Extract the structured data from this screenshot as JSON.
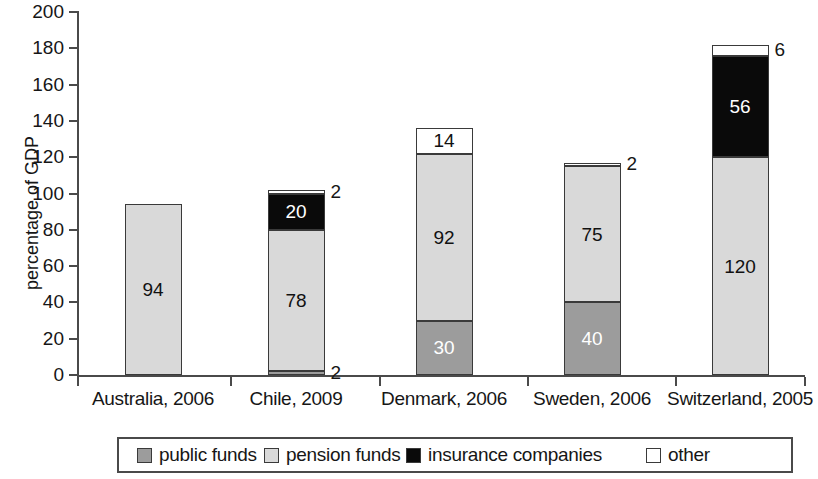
{
  "chart_data": {
    "type": "bar",
    "subtype": "stacked-bar",
    "title": "",
    "xlabel": "",
    "ylabel": "percentage of GDP",
    "ylim": [
      0,
      200
    ],
    "ytick_step": 20,
    "yticks": [
      "200",
      "180",
      "160",
      "140",
      "120",
      "100",
      "80",
      "60",
      "40",
      "20",
      "0"
    ],
    "grid": false,
    "legend_position": "bottom",
    "categories": [
      "Australia, 2006",
      "Chile, 2009",
      "Denmark, 2006",
      "Sweden, 2006",
      "Switzerland, 2005"
    ],
    "series": [
      {
        "name": "public funds",
        "color": "#9c9c9c",
        "values": [
          0,
          2,
          30,
          40,
          0
        ]
      },
      {
        "name": "pension funds",
        "color": "#d9d9d9",
        "values": [
          94,
          78,
          92,
          75,
          120
        ]
      },
      {
        "name": "insurance companies",
        "color": "#0a0a0a",
        "values": [
          0,
          20,
          0,
          0,
          56
        ]
      },
      {
        "name": "other",
        "color": "#ffffff",
        "values": [
          0,
          2,
          14,
          2,
          6
        ]
      }
    ],
    "totals": [
      94,
      102,
      136,
      117,
      182
    ]
  },
  "axis": {
    "y_title": "percentage of GDP"
  },
  "yticks": [
    {
      "value": "200"
    },
    {
      "value": "180"
    },
    {
      "value": "160"
    },
    {
      "value": "140"
    },
    {
      "value": "120"
    },
    {
      "value": "100"
    },
    {
      "value": "80"
    },
    {
      "value": "60"
    },
    {
      "value": "40"
    },
    {
      "value": "20"
    },
    {
      "value": "0"
    }
  ],
  "bars": [
    {
      "category": "Australia, 2006",
      "segments": [
        {
          "series": "pension funds",
          "value": 94,
          "label": "94",
          "label_placement": "inside"
        }
      ]
    },
    {
      "category": "Chile, 2009",
      "segments": [
        {
          "series": "public funds",
          "value": 2,
          "label": "2",
          "label_placement": "outside-right"
        },
        {
          "series": "pension funds",
          "value": 78,
          "label": "78",
          "label_placement": "inside"
        },
        {
          "series": "insurance companies",
          "value": 20,
          "label": "20",
          "label_placement": "inside"
        },
        {
          "series": "other",
          "value": 2,
          "label": "2",
          "label_placement": "outside-right"
        }
      ]
    },
    {
      "category": "Denmark, 2006",
      "segments": [
        {
          "series": "public funds",
          "value": 30,
          "label": "30",
          "label_placement": "inside"
        },
        {
          "series": "pension funds",
          "value": 92,
          "label": "92",
          "label_placement": "inside"
        },
        {
          "series": "other",
          "value": 14,
          "label": "14",
          "label_placement": "inside"
        }
      ]
    },
    {
      "category": "Sweden, 2006",
      "segments": [
        {
          "series": "public funds",
          "value": 40,
          "label": "40",
          "label_placement": "inside"
        },
        {
          "series": "pension funds",
          "value": 75,
          "label": "75",
          "label_placement": "inside"
        },
        {
          "series": "other",
          "value": 2,
          "label": "2",
          "label_placement": "outside-right"
        }
      ]
    },
    {
      "category": "Switzerland, 2005",
      "segments": [
        {
          "series": "pension funds",
          "value": 120,
          "label": "120",
          "label_placement": "inside"
        },
        {
          "series": "insurance companies",
          "value": 56,
          "label": "56",
          "label_placement": "inside"
        },
        {
          "series": "other",
          "value": 6,
          "label": "6",
          "label_placement": "outside-right"
        }
      ]
    }
  ],
  "xlabels": [
    {
      "text": "Australia, 2006"
    },
    {
      "text": "Chile, 2009"
    },
    {
      "text": "Denmark, 2006"
    },
    {
      "text": "Sweden, 2006"
    },
    {
      "text": "Switzerland, 2005"
    }
  ],
  "legend": {
    "items": [
      {
        "label": "public funds",
        "swatch": "public",
        "color": "#9c9c9c"
      },
      {
        "label": "pension funds",
        "swatch": "pension",
        "color": "#d9d9d9"
      },
      {
        "label": "insurance companies",
        "swatch": "insurance",
        "color": "#0a0a0a"
      },
      {
        "label": "other",
        "swatch": "other",
        "color": "#ffffff"
      }
    ]
  }
}
